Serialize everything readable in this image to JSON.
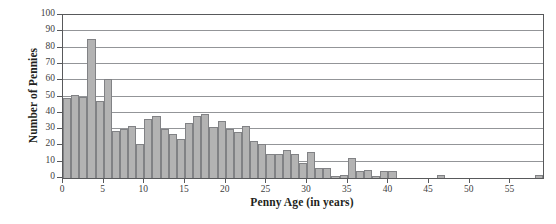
{
  "chart_data": {
    "type": "bar",
    "title": "",
    "subtitle": "",
    "xlabel": "Penny Age (in years)",
    "ylabel": "Number of Pennies",
    "xlim": [
      0,
      59
    ],
    "ylim": [
      0,
      100
    ],
    "ytick_values": [
      0,
      10,
      20,
      30,
      40,
      50,
      60,
      70,
      80,
      90,
      100
    ],
    "ytick_labels": [
      "0",
      "10",
      "20",
      "30",
      "40",
      "50",
      "60",
      "70",
      "80",
      "90",
      "100"
    ],
    "xtick_values": [
      0,
      5,
      10,
      15,
      20,
      25,
      30,
      35,
      40,
      45,
      50,
      55
    ],
    "xtick_labels": [
      "0",
      "5",
      "10",
      "15",
      "20",
      "25",
      "30",
      "35",
      "40",
      "45",
      "50",
      "55"
    ],
    "grid": "horizontal",
    "legend": "none",
    "bin_width": 1,
    "bar_color": "#b3b3b3",
    "bar_edge_color": "#818285",
    "axis_color": "#58595b",
    "gridline_color": "#939598",
    "text_color": "#231f20",
    "categories": [
      0,
      1,
      2,
      3,
      4,
      5,
      6,
      7,
      8,
      9,
      10,
      11,
      12,
      13,
      14,
      15,
      16,
      17,
      18,
      19,
      20,
      21,
      22,
      23,
      24,
      25,
      26,
      27,
      28,
      29,
      30,
      31,
      32,
      33,
      34,
      35,
      36,
      37,
      38,
      39,
      40,
      41,
      42,
      43,
      44,
      45,
      46,
      47,
      48,
      49,
      50,
      51,
      52,
      53,
      54,
      55,
      56,
      57,
      58
    ],
    "values": [
      49,
      51,
      50,
      85,
      47,
      61,
      29,
      30,
      32,
      21,
      36,
      38,
      30,
      27,
      24,
      34,
      38,
      39,
      31,
      35,
      30,
      28,
      32,
      23,
      21,
      15,
      15,
      17,
      15,
      9,
      16,
      6,
      6,
      1,
      2,
      12,
      4,
      5,
      1,
      4,
      4,
      0,
      0,
      0,
      0,
      0,
      2,
      0,
      0,
      0,
      0,
      0,
      0,
      0,
      0,
      0,
      0,
      0,
      2
    ]
  }
}
